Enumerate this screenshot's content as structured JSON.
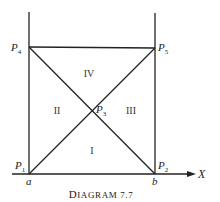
{
  "diagram": {
    "caption": {
      "initial": "D",
      "rest": "IAGRAM 7.7"
    },
    "axis": {
      "x_label": "X"
    },
    "ticks": {
      "a": "a",
      "b": "b"
    },
    "points": [
      {
        "id": "P1",
        "base": "P",
        "sub": "1",
        "x": 29,
        "y": 174
      },
      {
        "id": "P2",
        "base": "P",
        "sub": "2",
        "x": 155,
        "y": 174
      },
      {
        "id": "P3",
        "base": "P",
        "sub": "3",
        "x": 92,
        "y": 111
      },
      {
        "id": "P4",
        "base": "P",
        "sub": "4",
        "x": 29,
        "y": 47
      },
      {
        "id": "P5",
        "base": "P",
        "sub": "5",
        "x": 155,
        "y": 48
      }
    ],
    "regions": {
      "top": "IV",
      "left": "II",
      "right": "III",
      "bottom": "I"
    },
    "colors": {
      "line": "#222222",
      "background": "#ffffff"
    }
  }
}
